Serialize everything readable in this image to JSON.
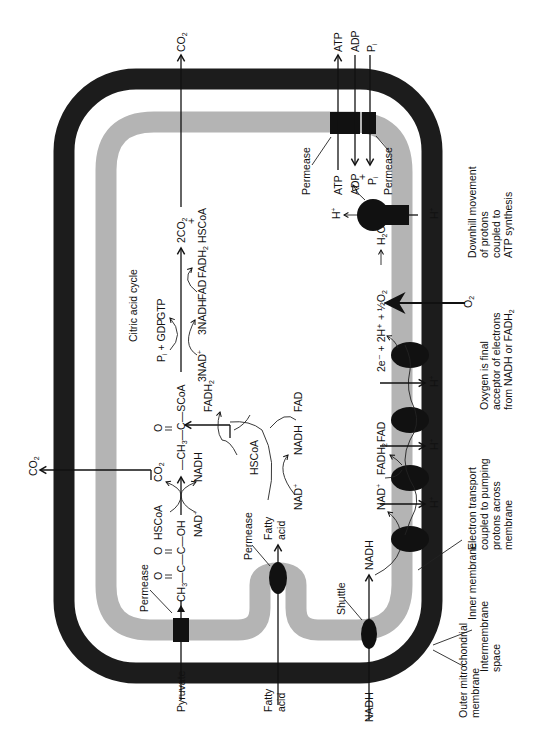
{
  "diagram": {
    "orientation": "rotated 90 degrees counterclockwise",
    "colors": {
      "outer_membrane": "#1c1c1c",
      "inner_membrane": "#b4b4b4",
      "protein": "#111111",
      "background": "#ffffff"
    },
    "structures": {
      "outer_membrane": "Outer mitrochondrial membrane",
      "intermembrane_space": "Intermembrane space",
      "inner_membrane": "Inner membrane",
      "shuttle": "Shuttle",
      "permease_pyruvate": "Permease",
      "permease_fatty_acid": "Permease",
      "permease_atp": "Permease",
      "permease_adp": "Permease"
    },
    "inputs": {
      "pyruvate": "Pyruvate",
      "fatty_acid_outside": "Fatty acid",
      "nadh_outside": "NADH",
      "o2": "O",
      "o2_sub": "2"
    },
    "outputs": {
      "co2_top": "CO",
      "co2_top_sub": "2",
      "co2_left": "CO",
      "co2_left_sub": "2",
      "atp": "ATP",
      "adp": "ADP",
      "pi": "P",
      "pi_sub": "i"
    },
    "pyruvate_pathway": {
      "ch3": "CH",
      "ch3_sub": "3",
      "chain": "—C—C—OH",
      "o1": "O",
      "o2": "O",
      "hscoa": "HSCoA",
      "nad": "NAD",
      "nad_sup": "+",
      "co2": "CO",
      "co2_sub": "2",
      "nadh": "NADH",
      "acetyl": "—CH",
      "acetyl_sub": "3",
      "acetyl_rest": "—C—SCoA",
      "acetyl_o": "O"
    },
    "fatty_acid_pathway": {
      "fatty_acid": "Fatty acid",
      "hscoa": "HSCoA",
      "fadh2": "FADH",
      "fadh2_sub": "2",
      "fad": "FAD",
      "nad": "NAD",
      "nad_sup": "+",
      "nadh": "NADH"
    },
    "citric_acid_cycle": {
      "title": "Citric acid cycle",
      "pi_gdp": "P",
      "pi_gdp_sub": "i",
      "pi_gdp_rest": " + GDP",
      "gtp": "GTP",
      "nad3": "3NAD",
      "nad3_sup": "+",
      "nadh3": "3NADH",
      "fad": "FAD",
      "fadh2": "FADH",
      "fadh2_sub": "2",
      "product_co2": "2CO",
      "product_co2_sub": "2",
      "product_plus": "+",
      "product_hscoa": "HSCoA"
    },
    "electron_transport": {
      "nadh": "NADH",
      "nad": "NAD",
      "nad_sup": "+",
      "fadh2": "FADH",
      "fadh2_sub": "2",
      "fad": "FAD",
      "h_plus": "H",
      "h_sup": "+",
      "reaction": "2e⁻ + 2H⁺ + ½O",
      "reaction_sub": "2",
      "arrow": "⟶",
      "water": "H",
      "water_sub": "2",
      "water_o": "O"
    },
    "atp_synthase": {
      "atp": "ATP",
      "adp": "ADP",
      "plus": "+",
      "pi": "P",
      "pi_sub": "i",
      "h_plus": "H",
      "h_sup": "+"
    },
    "annotations": {
      "electron_transport": [
        "Electron transport",
        "coupled to pumping",
        "protons across",
        "membrane"
      ],
      "oxygen": [
        "Oxygen is final",
        "acceptor of electrons",
        "from NADH or FADH"
      ],
      "oxygen_sub": "2",
      "downhill": [
        "Downhill movement",
        "of protons",
        "coupled to",
        "ATP synthesis"
      ],
      "outer": [
        "Outer mitrochondrial",
        "membrane"
      ],
      "intermembrane": [
        "Intermembrane",
        "space"
      ],
      "inner": "Inner membrane"
    }
  }
}
